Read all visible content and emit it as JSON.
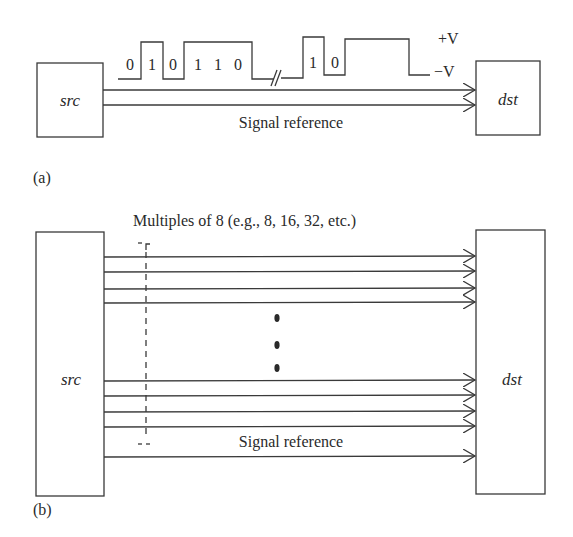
{
  "figure": {
    "panel_a": {
      "label": "(a)",
      "src_label": "src",
      "dst_label": "dst",
      "signal_reference_label": "Signal reference",
      "voltage_high_label": "+V",
      "voltage_low_label": "−V",
      "bits_before_break": [
        "0",
        "1",
        "0",
        "1",
        "1",
        "0"
      ],
      "bits_after_break": [
        "1",
        "0"
      ],
      "line_count": 2
    },
    "panel_b": {
      "label": "(b)",
      "src_label": "src",
      "dst_label": "dst",
      "bus_width_label": "Multiples of 8 (e.g., 8, 16, 32, etc.)",
      "signal_reference_label": "Signal reference",
      "ellipsis": "⋮",
      "top_line_count": 4,
      "bottom_line_count": 4,
      "reference_line_count": 1
    },
    "colors": {
      "line": "#3a3a3a",
      "text": "#2a2a2a",
      "background": "#ffffff"
    }
  }
}
